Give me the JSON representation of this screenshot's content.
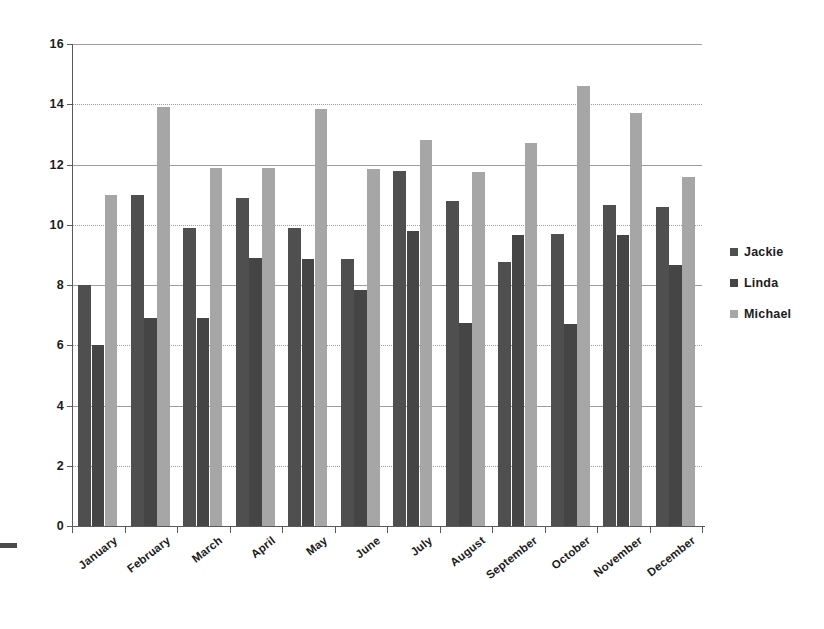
{
  "chart_data": {
    "type": "bar",
    "title": "",
    "subtitle": "",
    "xlabel": "",
    "ylabel": "",
    "grid": true,
    "legend_position": "right",
    "ylim": [
      0,
      16
    ],
    "y_ticks": [
      0,
      2,
      4,
      6,
      8,
      10,
      12,
      14,
      16
    ],
    "categories": [
      "January",
      "February",
      "March",
      "April",
      "May",
      "June",
      "July",
      "August",
      "September",
      "October",
      "November",
      "December"
    ],
    "series": [
      {
        "name": "Jackie",
        "color": "#4f4f4f",
        "values": [
          8.0,
          11.0,
          9.9,
          10.9,
          9.9,
          8.85,
          11.8,
          10.8,
          8.75,
          9.7,
          10.65,
          10.6
        ]
      },
      {
        "name": "Linda",
        "color": "#454545",
        "values": [
          6.0,
          6.9,
          6.9,
          8.9,
          8.85,
          7.85,
          9.8,
          6.75,
          9.65,
          6.7,
          9.65,
          8.65
        ]
      },
      {
        "name": "Michael",
        "color": "#a6a6a6",
        "values": [
          11.0,
          13.9,
          11.9,
          11.9,
          13.85,
          11.85,
          12.8,
          11.75,
          12.7,
          14.6,
          13.7,
          11.6
        ]
      }
    ]
  },
  "legend": {
    "items": [
      {
        "label": "Jackie",
        "color": "#4f4f4f"
      },
      {
        "label": "Linda",
        "color": "#454545"
      },
      {
        "label": "Michael",
        "color": "#a6a6a6"
      }
    ]
  }
}
